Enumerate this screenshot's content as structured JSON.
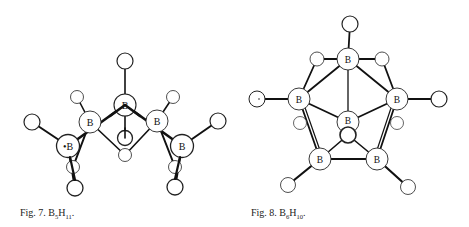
{
  "figures": [
    {
      "id": "fig7",
      "caption": {
        "label": "Fig. 7.",
        "formula_main": "B",
        "sub1": "5",
        "formula_second": "H",
        "sub2": "11",
        "trailing": "."
      },
      "molecule": "B5H11",
      "atoms": {
        "boron": [
          {
            "label": "B",
            "x": 125,
            "y": 105
          },
          {
            "label": "B",
            "x": 90,
            "y": 122
          },
          {
            "label": "B",
            "x": 157,
            "y": 121
          },
          {
            "label": "•B",
            "x": 68,
            "y": 146
          },
          {
            "label": "B",
            "x": 182,
            "y": 146
          }
        ],
        "hydrogen": [
          {
            "x": 125,
            "y": 61
          },
          {
            "x": 77,
            "y": 97
          },
          {
            "x": 173,
            "y": 97
          },
          {
            "x": 32,
            "y": 122
          },
          {
            "x": 218,
            "y": 121
          },
          {
            "x": 125,
            "y": 138
          },
          {
            "x": 125,
            "y": 155
          },
          {
            "x": 73,
            "y": 167
          },
          {
            "x": 75,
            "y": 188
          },
          {
            "x": 175,
            "y": 167
          },
          {
            "x": 175,
            "y": 187
          }
        ]
      }
    },
    {
      "id": "fig8",
      "caption": {
        "label": "Fig. 8.",
        "formula_main": "B",
        "sub1": "6",
        "formula_second": "H",
        "sub2": "10",
        "trailing": "."
      },
      "molecule": "B6H10",
      "atoms": {
        "boron": [
          {
            "label": "B",
            "x": 348,
            "y": 59
          },
          {
            "label": "B",
            "x": 299,
            "y": 99
          },
          {
            "label": "B",
            "x": 397,
            "y": 99
          },
          {
            "label": "B",
            "x": 348,
            "y": 122
          },
          {
            "label": "B",
            "x": 320,
            "y": 159
          },
          {
            "label": "B",
            "x": 377,
            "y": 159
          }
        ],
        "hydrogen": [
          {
            "x": 350,
            "y": 24
          },
          {
            "x": 317,
            "y": 59
          },
          {
            "x": 382,
            "y": 59
          },
          {
            "x": 257,
            "y": 99
          },
          {
            "x": 439,
            "y": 99
          },
          {
            "x": 348,
            "y": 135
          },
          {
            "x": 300,
            "y": 123
          },
          {
            "x": 397,
            "y": 123
          },
          {
            "x": 288,
            "y": 185
          },
          {
            "x": 408,
            "y": 187
          }
        ]
      }
    }
  ]
}
